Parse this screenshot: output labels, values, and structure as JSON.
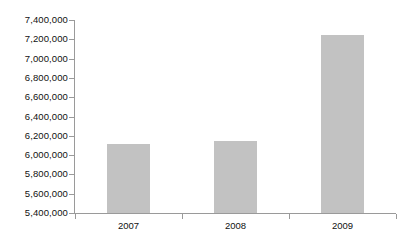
{
  "chart_data": {
    "type": "bar",
    "title": "",
    "subtitle": "",
    "xlabel": "",
    "ylabel": "",
    "categories": [
      "2007",
      "2008",
      "2009"
    ],
    "values": [
      6120000,
      6145000,
      7240000
    ],
    "series": [
      {
        "name": "",
        "values": [
          6120000,
          6145000,
          7240000
        ]
      }
    ],
    "ylim": [
      5400000,
      7400000
    ],
    "ytick_step": 200000,
    "ytick_labels": [
      "7,400,000",
      "7,200,000",
      "7,000,000",
      "6,800,000",
      "6,600,000",
      "6,400,000",
      "6,200,000",
      "6,000,000",
      "5,800,000",
      "5,600,000",
      "5,400,000"
    ],
    "ytick_values": [
      7400000,
      7200000,
      7000000,
      6800000,
      6600000,
      6400000,
      6200000,
      6000000,
      5800000,
      5600000,
      5400000
    ],
    "grid": false,
    "legend": false,
    "legend_position": "none",
    "annotations": [],
    "colors": {
      "bar_fill": "#c2c2c2",
      "axis_line": "#9a9a9a",
      "text": "#111111",
      "background": "#ffffff"
    }
  }
}
